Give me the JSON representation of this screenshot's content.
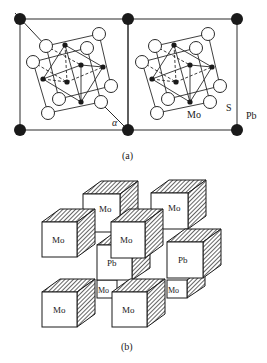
{
  "figure_a": {
    "caption": "(a)",
    "labels": {
      "alpha": "α",
      "mo": "Mo",
      "s": "S",
      "pb": "Pb"
    },
    "colors": {
      "line": "#2a2a2a",
      "pb_atom": "#1a1a1a",
      "s_atom_fill": "#ffffff",
      "mo_atom": "#1a1a1a"
    }
  },
  "figure_b": {
    "caption": "(b)",
    "cubes": [
      {
        "label": "Mo"
      },
      {
        "label": "Mo"
      },
      {
        "label": "Mo"
      },
      {
        "label": "Pb"
      },
      {
        "label": "Pb"
      },
      {
        "label": "Mo"
      },
      {
        "label": "Mo"
      },
      {
        "label": "Mo"
      },
      {
        "label": "Mo"
      },
      {
        "label": "Mo"
      }
    ]
  }
}
